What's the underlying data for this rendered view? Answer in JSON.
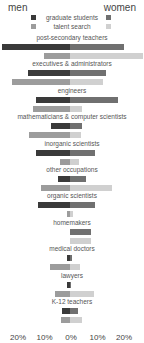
{
  "header": {
    "left": "men",
    "right": "women"
  },
  "legend": [
    {
      "label": "graduate students",
      "men_color": "#3a3a3a",
      "women_color": "#707070"
    },
    {
      "label": "talent search",
      "men_color": "#9c9c9c",
      "women_color": "#d0d0d0"
    }
  ],
  "axis": {
    "ticks": [
      "20%",
      "10%",
      "0%",
      "10%",
      "20%"
    ],
    "tick_values": [
      -20,
      -10,
      0,
      10,
      20
    ]
  },
  "chart_data": {
    "type": "bar",
    "title": "",
    "orientation": "horizontal-diverging",
    "xlabel": "",
    "ylabel": "",
    "xlim": [
      -26,
      27.5
    ],
    "legend": [
      "graduate students",
      "talent search"
    ],
    "sides": [
      "men",
      "women"
    ],
    "categories": [
      "post-secondary teachers",
      "executives & administrators",
      "engineers",
      "mathematicians & computer scientists",
      "inorganic scientists",
      "other occupations",
      "organic scientists",
      "homemakers",
      "medical doctors",
      "lawyers",
      "K-12 teachers"
    ],
    "series": [
      {
        "name": "graduate students - men",
        "values": [
          25.5,
          16,
          13,
          7,
          13,
          4.5,
          12,
          0,
          1,
          1,
          3
        ]
      },
      {
        "name": "graduate students - women",
        "values": [
          20.5,
          13.5,
          18,
          4.5,
          9.5,
          6,
          9.5,
          8,
          0.8,
          0.5,
          3
        ]
      },
      {
        "name": "talent search - men",
        "values": [
          10,
          22,
          14,
          15.5,
          3.8,
          11,
          1,
          0,
          7.5,
          5.7,
          3.4
        ]
      },
      {
        "name": "talent search - women",
        "values": [
          27.5,
          12.5,
          4.5,
          4,
          3.4,
          16,
          1,
          8,
          3.8,
          9,
          4.5
        ]
      }
    ]
  }
}
